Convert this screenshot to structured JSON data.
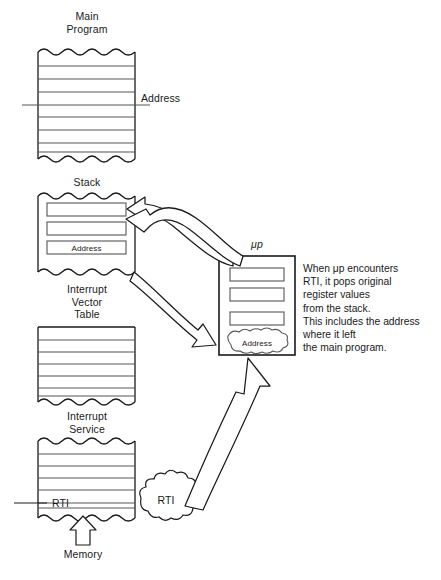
{
  "diagram": {
    "title_blocks": {
      "main_program": "Main\nProgram",
      "stack": "Stack",
      "interrupt_vector_table": "Interrupt\nVector\nTable",
      "interrupt_service": "Interrupt\nService",
      "microprocessor": "μp"
    },
    "labels": {
      "main_program_address": "Address",
      "stack_address_cell": "Address",
      "up_address_register": "Address",
      "rti_instruction": "RTI",
      "rti_cloud": "RTI",
      "memory": "Memory"
    },
    "description": "When μp encounters\nRTI, it pops original\nregister values\nfrom the stack.\nThis includes the address\nwhere it left\nthe main program.",
    "description_lines": [
      "When μp encounters",
      "RTI, it pops original",
      "register values",
      "from the stack.",
      "This includes the address",
      "where it left",
      "the main program."
    ],
    "stack_cells": [
      "",
      "",
      "Address"
    ],
    "up_registers": [
      "",
      "",
      ""
    ],
    "colors": {
      "stroke": "#1a1a1a",
      "row_line": "#555555",
      "background": "#ffffff",
      "text": "#1a1a1a"
    }
  }
}
